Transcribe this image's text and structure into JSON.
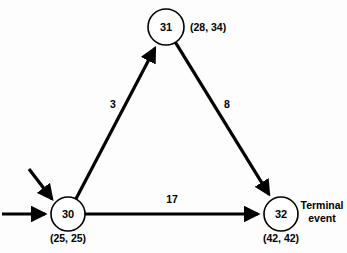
{
  "diagram": {
    "background_color": "#fdfdfd",
    "line_color": "#000000",
    "nodes": [
      {
        "id": "30",
        "label": "30",
        "times": "(25, 25)",
        "note": "",
        "cx": 68,
        "cy": 214,
        "r": 17
      },
      {
        "id": "31",
        "label": "31",
        "times": "(28, 34)",
        "note": "",
        "cx": 166,
        "cy": 27,
        "r": 18
      },
      {
        "id": "32",
        "label": "32",
        "times": "(42, 42)",
        "note": "Terminal event",
        "note_line1": "Terminal",
        "note_line2": "event",
        "cx": 281,
        "cy": 214,
        "r": 17
      }
    ],
    "edges": [
      {
        "from": "30",
        "to": "31",
        "weight": "3",
        "label_x": 113,
        "label_y": 108
      },
      {
        "from": "31",
        "to": "32",
        "weight": "8",
        "label_x": 227,
        "label_y": 108
      },
      {
        "from": "30",
        "to": "32",
        "weight": "17",
        "label_x": 172,
        "label_y": 203
      }
    ],
    "entry_arrows": [
      {
        "name": "diagonal-entry-arrow",
        "x1": 29,
        "x2": 52,
        "y1": 169,
        "y2": 199
      },
      {
        "name": "horizontal-entry-arrow",
        "x1": 2,
        "x2": 45,
        "y1": 214,
        "y2": 214
      }
    ]
  },
  "chart_data": {
    "type": "diagram",
    "nodes": [
      {
        "event": 30,
        "earliest": 25,
        "latest": 25
      },
      {
        "event": 31,
        "earliest": 28,
        "latest": 34
      },
      {
        "event": 32,
        "earliest": 42,
        "latest": 42
      }
    ],
    "edges": [
      {
        "from": 30,
        "to": 31,
        "duration": 3
      },
      {
        "from": 31,
        "to": 32,
        "duration": 8
      },
      {
        "from": 30,
        "to": 32,
        "duration": 17
      }
    ],
    "annotations": [
      "Terminal event"
    ]
  }
}
